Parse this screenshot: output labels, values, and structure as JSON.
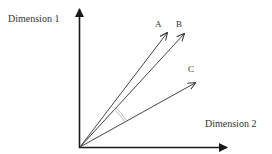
{
  "diagram": {
    "axes": {
      "y_label": "Dimension 1",
      "x_label": "Dimension 2",
      "color": "#1a1a1a"
    },
    "vectors": [
      {
        "name": "A",
        "tip": [
          167,
          33
        ]
      },
      {
        "name": "B",
        "tip": [
          184,
          34
        ]
      },
      {
        "name": "C",
        "tip": [
          195,
          83
        ]
      }
    ],
    "angle_marker": {
      "between": [
        "B",
        "C"
      ],
      "color": "#999999"
    },
    "vector_color": "#444444"
  }
}
